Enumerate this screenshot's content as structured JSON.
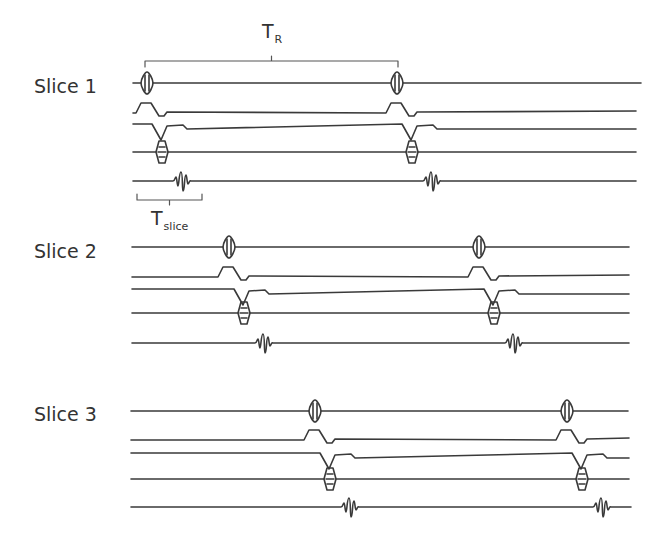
{
  "figure": {
    "line_color": "#3a3a3a",
    "background": "#ffffff"
  },
  "annotations": {
    "tr": {
      "main": "T",
      "sub": "R",
      "x_start": 145,
      "x_end": 398,
      "y": 61,
      "label_x": 262,
      "label_y": 30
    },
    "tslice": {
      "main": "T",
      "sub": "slice",
      "x_start": 137,
      "x_end": 202,
      "y": 200,
      "label_x": 151,
      "label_y": 207
    }
  },
  "slices": [
    {
      "label": "Slice 1",
      "label_x": 34,
      "label_y": 87,
      "x_start": 133,
      "rows": {
        "rf": 83,
        "gss": 111,
        "gpe": 125,
        "gfe": 152,
        "signal": 181
      },
      "ends": {
        "rf": 641,
        "gss": 636,
        "gpe": 636,
        "gfe": 636,
        "signal": 636
      },
      "events": [
        147,
        397
      ]
    },
    {
      "label": "Slice 2",
      "label_x": 34,
      "label_y": 252,
      "x_start": 132,
      "rows": {
        "rf": 247,
        "gss": 275,
        "gpe": 290,
        "gfe": 313,
        "signal": 343
      },
      "ends": {
        "rf": 629,
        "gss": 629,
        "gpe": 629,
        "gfe": 629,
        "signal": 629
      },
      "events": [
        229,
        479
      ]
    },
    {
      "label": "Slice 3",
      "label_x": 34,
      "label_y": 415,
      "x_start": 131,
      "rows": {
        "rf": 411,
        "gss": 438,
        "gpe": 454,
        "gfe": 479,
        "signal": 507
      },
      "ends": {
        "rf": 628,
        "gss": 629,
        "gpe": 629,
        "gfe": 629,
        "signal": 631
      },
      "events": [
        315,
        567
      ]
    }
  ],
  "row_types": [
    "rf-pulse",
    "slice-select-gradient",
    "phase-encode-gradient",
    "frequency-encode-gradient",
    "echo-signal"
  ]
}
